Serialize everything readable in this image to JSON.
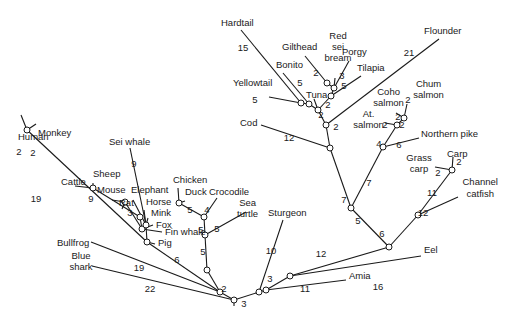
{
  "diagram": {
    "type": "phylogenetic-tree",
    "taxa": [
      {
        "id": "human",
        "label": [
          "Human"
        ]
      },
      {
        "id": "monkey",
        "label": [
          "Monkey"
        ]
      },
      {
        "id": "cattle",
        "label": [
          "Cattle"
        ]
      },
      {
        "id": "sheep",
        "label": [
          "Sheep"
        ]
      },
      {
        "id": "mouse",
        "label": [
          "Mouse"
        ]
      },
      {
        "id": "rat",
        "label": [
          "Rat"
        ]
      },
      {
        "id": "sei_whale",
        "label": [
          "Sei whale"
        ]
      },
      {
        "id": "elephant",
        "label": [
          "Elephant"
        ]
      },
      {
        "id": "horse",
        "label": [
          "Horse"
        ]
      },
      {
        "id": "mink",
        "label": [
          "Mink"
        ]
      },
      {
        "id": "fox",
        "label": [
          "Fox"
        ]
      },
      {
        "id": "fin_whale",
        "label": [
          "Fin whale"
        ]
      },
      {
        "id": "pig",
        "label": [
          "Pig"
        ]
      },
      {
        "id": "chicken",
        "label": [
          "Chicken"
        ]
      },
      {
        "id": "duck",
        "label": [
          "Duck"
        ]
      },
      {
        "id": "crocodile",
        "label": [
          "Crocodile"
        ]
      },
      {
        "id": "sea_turtle",
        "label": [
          "Sea",
          "turtle"
        ]
      },
      {
        "id": "bullfrog",
        "label": [
          "Bullfrog"
        ]
      },
      {
        "id": "blue_shark",
        "label": [
          "Blue",
          "shark"
        ]
      },
      {
        "id": "sturgeon",
        "label": [
          "Sturgeon"
        ]
      },
      {
        "id": "amia",
        "label": [
          "Amia"
        ]
      },
      {
        "id": "eel",
        "label": [
          "Eel"
        ]
      },
      {
        "id": "channel_catfish",
        "label": [
          "Channel",
          "catfish"
        ]
      },
      {
        "id": "carp",
        "label": [
          "Carp"
        ]
      },
      {
        "id": "grass_carp",
        "label": [
          "Grass",
          "carp"
        ]
      },
      {
        "id": "northern_pike",
        "label": [
          "Northern pike"
        ]
      },
      {
        "id": "at_salmon",
        "label": [
          "At.",
          "salmon"
        ]
      },
      {
        "id": "coho_salmon",
        "label": [
          "Coho",
          "salmon"
        ]
      },
      {
        "id": "chum_salmon",
        "label": [
          "Chum",
          "salmon"
        ]
      },
      {
        "id": "cod",
        "label": [
          "Cod"
        ]
      },
      {
        "id": "flounder",
        "label": [
          "Flounder"
        ]
      },
      {
        "id": "hardtail",
        "label": [
          "Hardtail"
        ]
      },
      {
        "id": "yellowtail",
        "label": [
          "Yellowtail"
        ]
      },
      {
        "id": "bonito",
        "label": [
          "Bonito"
        ]
      },
      {
        "id": "tuna",
        "label": [
          "Tuna"
        ]
      },
      {
        "id": "gilthead",
        "label": [
          "Gilthead"
        ]
      },
      {
        "id": "red_sei_bream",
        "label": [
          "Red",
          "sei",
          "bream"
        ]
      },
      {
        "id": "porgy",
        "label": [
          "Porgy"
        ]
      },
      {
        "id": "tilapia",
        "label": [
          "Tilapia"
        ]
      }
    ],
    "branch_lengths": [
      {
        "edge": "human",
        "value": "2"
      },
      {
        "edge": "monkey",
        "value": "2"
      },
      {
        "edge": "primates",
        "value": "19"
      },
      {
        "edge": "sheep",
        "value": "9"
      },
      {
        "edge": "rat",
        "value": "3"
      },
      {
        "edge": "sei_whale",
        "value": "9"
      },
      {
        "edge": "mammals",
        "value": "6"
      },
      {
        "edge": "chicken",
        "value": "5"
      },
      {
        "edge": "duck_crocodile",
        "value": "4"
      },
      {
        "edge": "sea_turtle",
        "value": "5"
      },
      {
        "edge": "birds",
        "value": "5"
      },
      {
        "edge": "reptiles",
        "value": "5"
      },
      {
        "edge": "bullfrog",
        "value": "19"
      },
      {
        "edge": "tetrapods",
        "value": "2"
      },
      {
        "edge": "blue_shark",
        "value": "22"
      },
      {
        "edge": "bony_fish",
        "value": "3"
      },
      {
        "edge": "sturgeon",
        "value": "10"
      },
      {
        "edge": "amia",
        "value": "11"
      },
      {
        "edge": "teleost_stem",
        "value": "3"
      },
      {
        "edge": "eel",
        "value": "16"
      },
      {
        "edge": "euteleosts",
        "value": "12"
      },
      {
        "edge": "ostariophysi",
        "value": "6"
      },
      {
        "edge": "channel_catfish",
        "value": "12"
      },
      {
        "edge": "cyprinids",
        "value": "11"
      },
      {
        "edge": "carp",
        "value": "2"
      },
      {
        "edge": "grass_carp",
        "value": "2"
      },
      {
        "edge": "neoteleosts",
        "value": "5"
      },
      {
        "edge": "salmoniformes",
        "value": "7"
      },
      {
        "edge": "northern_pike",
        "value": "6"
      },
      {
        "edge": "salmonids",
        "value": "4"
      },
      {
        "edge": "at_salmon",
        "value": "2"
      },
      {
        "edge": "pacific_salmon",
        "value": "2"
      },
      {
        "edge": "coho_salmon",
        "value": "2"
      },
      {
        "edge": "chum_salmon",
        "value": "2"
      },
      {
        "edge": "acanthopterygii",
        "value": "7"
      },
      {
        "edge": "cod",
        "value": "12"
      },
      {
        "edge": "percomorphs",
        "value": "2"
      },
      {
        "edge": "flounder",
        "value": "21"
      },
      {
        "edge": "perciform_core",
        "value": "2"
      },
      {
        "edge": "hardtail",
        "value": "15"
      },
      {
        "edge": "yellowtail",
        "value": "5"
      },
      {
        "edge": "bonito",
        "value": "5"
      },
      {
        "edge": "sparid_clade",
        "value": "2"
      },
      {
        "edge": "gilthead",
        "value": "2"
      },
      {
        "edge": "porgy",
        "value": "3"
      },
      {
        "edge": "tilapia",
        "value": "5"
      }
    ]
  }
}
